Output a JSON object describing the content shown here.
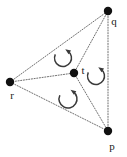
{
  "figure": {
    "name": "rotation-system-graph",
    "background_color": "#ffffff",
    "width": 127,
    "height": 157
  },
  "style": {
    "edge_color": "#4a4a4a",
    "edge_style": "dotted",
    "vertex_color": "#111111",
    "label_color": "#1a1a1a",
    "arrow_color": "#3a3a3a"
  },
  "vertices": [
    {
      "id": "q",
      "label": "q",
      "x": 108,
      "y": 11,
      "label_x": 114,
      "label_y": 25,
      "radius": 4.2
    },
    {
      "id": "r",
      "label": "r",
      "x": 10,
      "y": 82,
      "label_x": 12,
      "label_y": 99,
      "radius": 4.2
    },
    {
      "id": "t",
      "label": "t",
      "x": 74,
      "y": 73,
      "label_x": 83,
      "label_y": 74,
      "radius": 4.2
    },
    {
      "id": "p",
      "label": "p",
      "x": 108,
      "y": 131,
      "label_x": 112,
      "label_y": 150,
      "radius": 4.2
    }
  ],
  "edges": [
    {
      "id": "edge-r-q",
      "from": "r",
      "to": "q"
    },
    {
      "id": "edge-r-t",
      "from": "r",
      "to": "t"
    },
    {
      "id": "edge-r-p",
      "from": "r",
      "to": "p"
    },
    {
      "id": "edge-q-t",
      "from": "q",
      "to": "t"
    },
    {
      "id": "edge-q-p",
      "from": "q",
      "to": "p"
    },
    {
      "id": "edge-t-p",
      "from": "t",
      "to": "p"
    }
  ],
  "rotation_markers": [
    {
      "id": "rotation-upper",
      "label": "counterclockwise",
      "cx": 63,
      "cy": 58,
      "r": 8.5
    },
    {
      "id": "rotation-right",
      "label": "counterclockwise",
      "cx": 96,
      "cy": 76,
      "r": 8.5
    },
    {
      "id": "rotation-lower",
      "label": "counterclockwise",
      "cx": 68,
      "cy": 99,
      "r": 9.0
    }
  ]
}
